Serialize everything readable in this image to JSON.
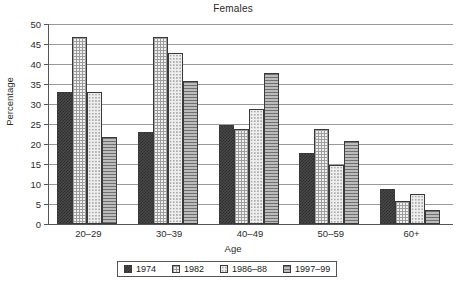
{
  "chart_data": {
    "type": "bar",
    "title": "Females",
    "xlabel": "Age",
    "ylabel": "Percentage",
    "categories": [
      "20–29",
      "30–39",
      "40–49",
      "50–59",
      "60+"
    ],
    "series": [
      {
        "name": "1974",
        "values": [
          33,
          23,
          24.7,
          17.8,
          8.7
        ]
      },
      {
        "name": "1982",
        "values": [
          46.8,
          46.7,
          23.7,
          23.8,
          5.7
        ]
      },
      {
        "name": "1986–88",
        "values": [
          32.9,
          42.8,
          28.7,
          14.7,
          7.6
        ]
      },
      {
        "name": "1997–99",
        "values": [
          21.8,
          35.8,
          37.8,
          20.8,
          3.6
        ]
      }
    ],
    "ylim": [
      0,
      50
    ],
    "ytick_labels": [
      "0",
      "5",
      "10",
      "15",
      "20",
      "25",
      "30",
      "35",
      "40",
      "45",
      "50"
    ],
    "ytick_values": [
      0,
      5,
      10,
      15,
      20,
      25,
      30,
      35,
      40,
      45,
      50
    ],
    "grid": true,
    "legend_position": "bottom",
    "colors": {
      "1974": "#4a4a4a",
      "1982": "#f0f0f0",
      "1986–88": "#efefef",
      "1997–99": "#bcbcbc",
      "axis": "#555555",
      "gridline": "#9a9a9a"
    }
  }
}
